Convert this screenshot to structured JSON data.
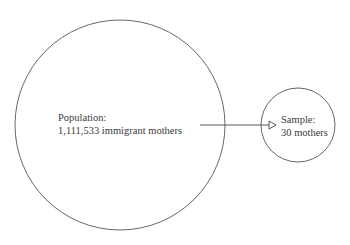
{
  "diagram": {
    "type": "population-sample",
    "population": {
      "title": "Population:",
      "description": "1,111,533 immigrant mothers",
      "circle": {
        "cx": 120,
        "cy": 125,
        "r": 105
      }
    },
    "sample": {
      "title": "Sample:",
      "description": "30 mothers",
      "circle": {
        "cx": 298,
        "cy": 125,
        "r": 37
      }
    },
    "arrow": {
      "from": "population",
      "to": "sample",
      "x1": 200,
      "y1": 125,
      "x2": 275,
      "y2": 125
    },
    "colors": {
      "stroke": "#555555",
      "text": "#3a3a3a",
      "background": "#ffffff"
    }
  }
}
